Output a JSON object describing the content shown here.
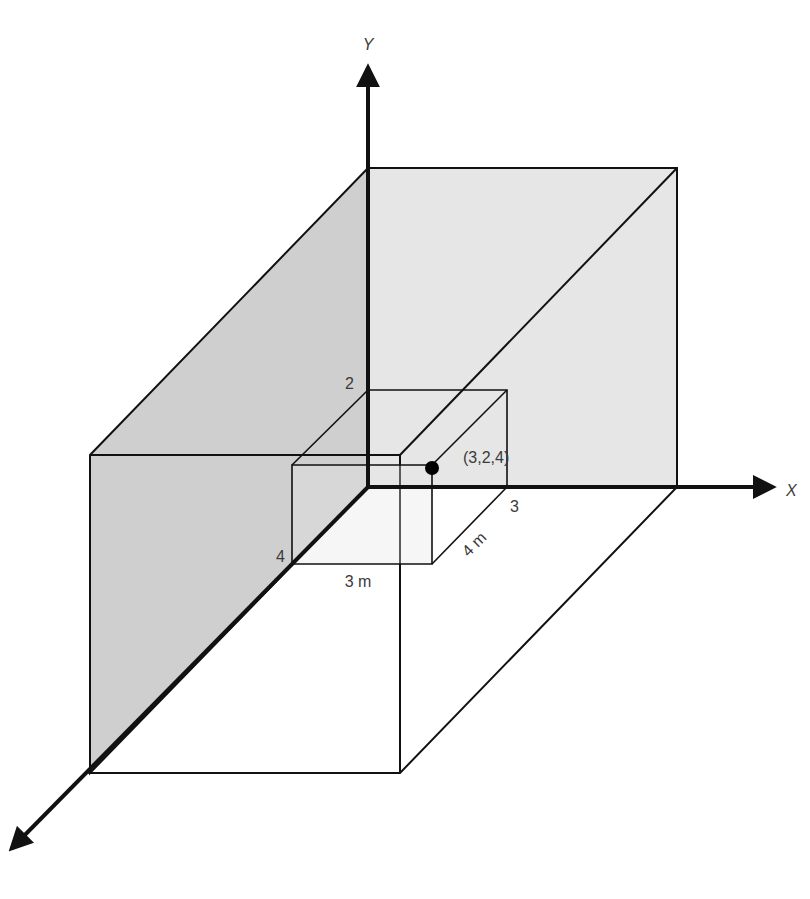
{
  "diagram": {
    "axes": {
      "x_label": "X",
      "y_label": "Y",
      "z_label": ""
    },
    "labels": {
      "y_tick": "2",
      "x_tick": "3",
      "z_tick": "4",
      "width_dim": "3 m",
      "depth_dim": "4 m",
      "point": "(3,2,4)"
    },
    "colors": {
      "back_wall": "#e6e6e6",
      "side_wall": "#cfcfcf",
      "floor": "#ffffff",
      "lines": "#111111",
      "point": "#000000"
    },
    "point_coords": {
      "x": 3,
      "y": 2,
      "z": 4
    },
    "box_dimensions": {
      "x": "3 m",
      "y": "2",
      "z": "4 m"
    }
  }
}
